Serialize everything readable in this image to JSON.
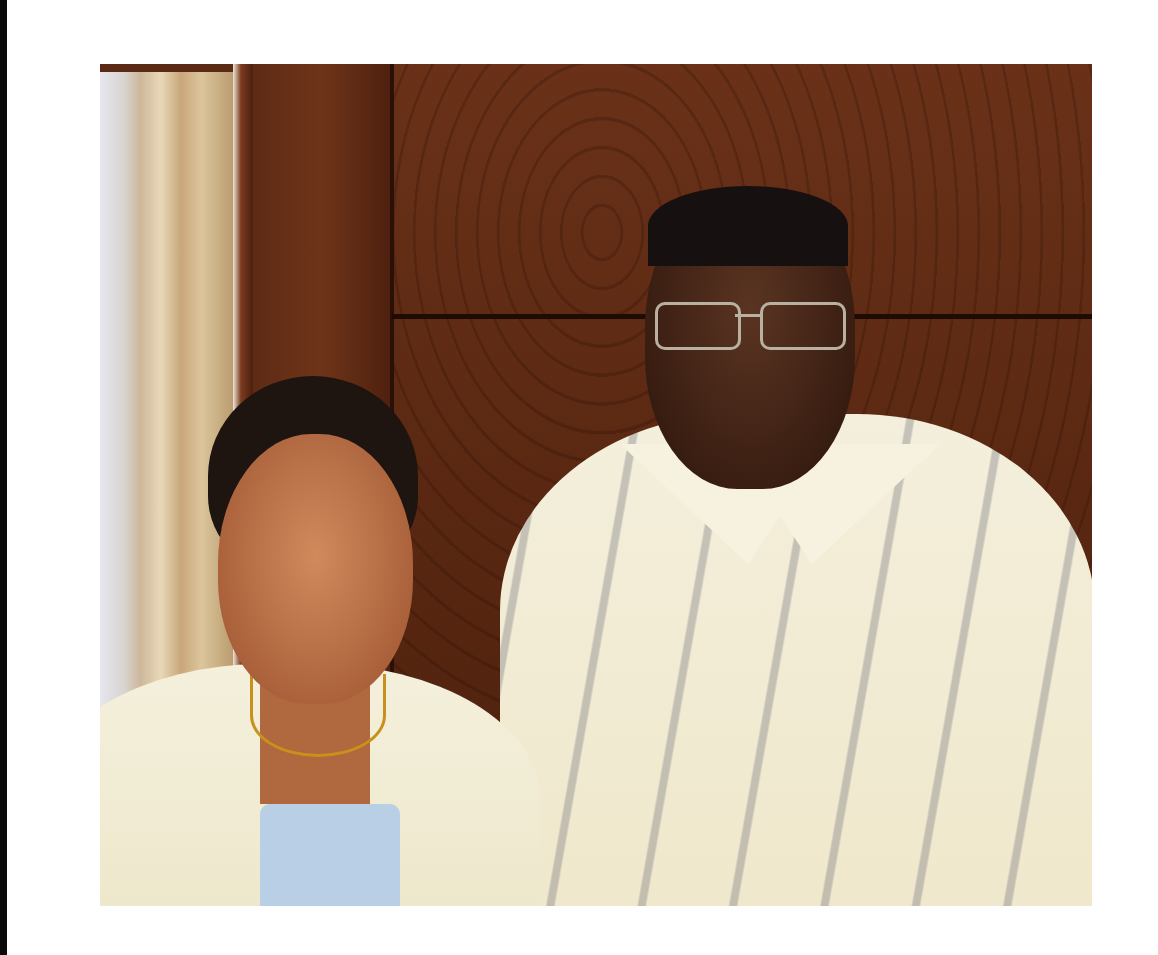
{
  "image": {
    "type": "photograph",
    "description": "Two people posing side by side in front of a dark wood-panel wall with a sheer curtain at left",
    "subjects": [
      {
        "id": "woman",
        "position": "left",
        "attire": "cream jacket over light blue top, gold necklace"
      },
      {
        "id": "man",
        "position": "right",
        "attire": "cream patterned short-sleeve shirt, wire-rimmed glasses"
      }
    ],
    "background": {
      "wall": "dark brown wood paneling with horizontal groove",
      "curtain": "sheer beige/white curtain"
    },
    "colors": {
      "page_background": "#ffffff",
      "wood": "#5a2812",
      "curtain": "#dcc59c",
      "jacket": "#f4f0dc",
      "top": "#b8cfe6",
      "shirt": "#efe8cc"
    }
  }
}
